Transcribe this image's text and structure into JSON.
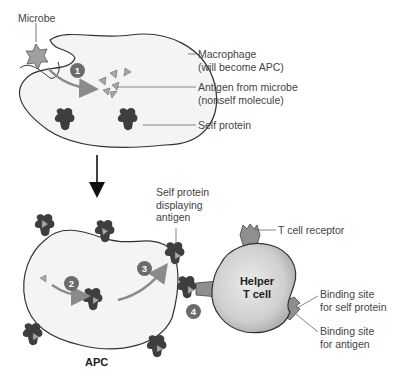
{
  "labels": {
    "microbe": "Microbe",
    "macrophage": [
      "Macrophage",
      "(will become APC)"
    ],
    "antigen": [
      "Antigen from microbe",
      "(nonself molecule)"
    ],
    "self_protein": "Self protein",
    "self_protein_displaying": [
      "Self protein",
      "displaying",
      "antigen"
    ],
    "t_cell_receptor": "T cell receptor",
    "helper_t_cell": [
      "Helper",
      "T cell"
    ],
    "binding_self": [
      "Binding site",
      "for self protein"
    ],
    "binding_antigen": [
      "Binding site",
      "for antigen"
    ],
    "apc": "APC"
  },
  "steps": [
    "1",
    "2",
    "3",
    "4"
  ],
  "colors": {
    "cell_fill": "#f4f4f4",
    "outline": "#333333",
    "protein": "#3e3e3e",
    "antigen": "#a8a8a8",
    "arrow_gray": "#8a8a8a",
    "tcell_fill": "#c9c9c9",
    "step_badge": "#6b6b6b"
  }
}
